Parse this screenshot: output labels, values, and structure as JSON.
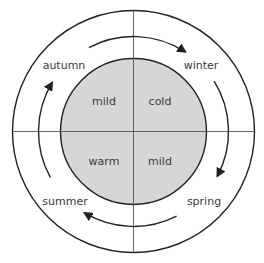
{
  "diagram": {
    "type": "seasonal-cycle",
    "colors": {
      "line": "#222222",
      "divider": "#555555",
      "inner_fill": "#d6d6d6",
      "text": "#3a3a3a",
      "background": "#ffffff"
    },
    "seasons": {
      "autumn": "autumn",
      "winter": "winter",
      "summer": "summer",
      "spring": "spring"
    },
    "quadrants": {
      "top_left": "mild",
      "top_right": "cold",
      "bottom_left": "warm",
      "bottom_right": "mild"
    },
    "arrows": [
      {
        "name": "autumn-to-winter",
        "direction": "clockwise"
      },
      {
        "name": "winter-to-spring",
        "direction": "clockwise"
      },
      {
        "name": "spring-to-summer",
        "direction": "clockwise"
      },
      {
        "name": "summer-to-autumn",
        "direction": "clockwise"
      }
    ]
  }
}
